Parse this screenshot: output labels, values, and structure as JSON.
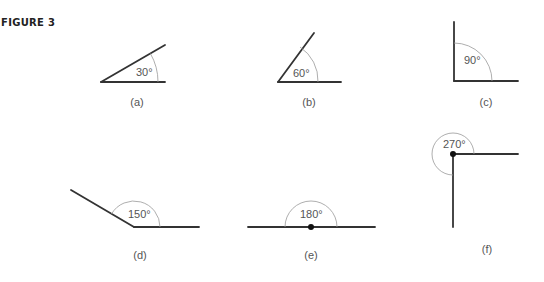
{
  "figure": {
    "title": "FIGURE 3",
    "panels": [
      {
        "id": "a",
        "caption": "(a)",
        "angle_label": "30°",
        "angle_deg": 30
      },
      {
        "id": "b",
        "caption": "(b)",
        "angle_label": "60°",
        "angle_deg": 60
      },
      {
        "id": "c",
        "caption": "(c)",
        "angle_label": "90°",
        "angle_deg": 90
      },
      {
        "id": "d",
        "caption": "(d)",
        "angle_label": "150°",
        "angle_deg": 150
      },
      {
        "id": "e",
        "caption": "(e)",
        "angle_label": "180°",
        "angle_deg": 180
      },
      {
        "id": "f",
        "caption": "(f)",
        "angle_label": "270°",
        "angle_deg": 270
      }
    ]
  }
}
